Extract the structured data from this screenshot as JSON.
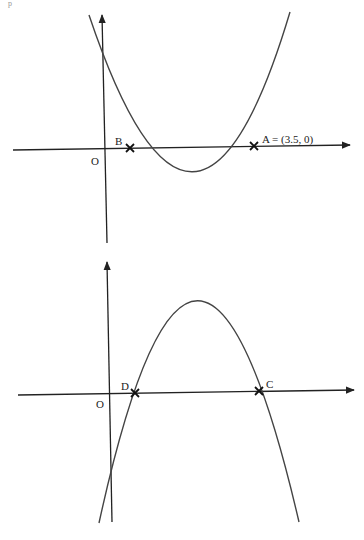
{
  "corner_mark": "p",
  "diagrams": [
    {
      "name": "upward-parabola",
      "origin_label": "O",
      "points": [
        {
          "label": "B",
          "text": "B"
        },
        {
          "label": "A",
          "text": "A  = (3.5, 0)"
        }
      ]
    },
    {
      "name": "downward-parabola",
      "origin_label": "O",
      "points": [
        {
          "label": "D",
          "text": "D"
        },
        {
          "label": "C",
          "text": "C"
        }
      ]
    }
  ],
  "colors": {
    "axis": "#222222",
    "curve": "#444444",
    "background": "#ffffff"
  }
}
